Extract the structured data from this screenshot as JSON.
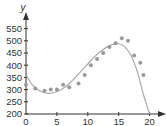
{
  "chart_data": {
    "type": "scatter",
    "title": "",
    "xlabel": "",
    "ylabel": "y",
    "xlim": [
      0,
      21
    ],
    "ylim": [
      200,
      580
    ],
    "x_ticks": [
      0,
      5,
      10,
      15,
      20
    ],
    "y_ticks": [
      200,
      250,
      300,
      350,
      400,
      450,
      500,
      550
    ],
    "grid": false,
    "legend": null,
    "series": [
      {
        "name": "data points",
        "type": "scatter",
        "color": "#999999",
        "x": [
          0,
          1.5,
          3,
          4,
          5,
          6,
          7,
          8.5,
          9.5,
          10.5,
          11.5,
          12.5,
          13.5,
          14.5,
          15.5,
          16.5,
          17.5,
          18.5,
          19
        ],
        "y": [
          320,
          305,
          295,
          300,
          300,
          320,
          310,
          325,
          360,
          400,
          425,
          450,
          475,
          490,
          510,
          500,
          440,
          410,
          360
        ]
      },
      {
        "name": "fitted curve",
        "type": "line",
        "color": "#aaaaaa",
        "x": [
          0,
          1,
          2,
          3,
          4,
          5,
          6,
          7,
          8,
          9,
          10,
          11,
          12,
          13,
          14,
          15,
          16,
          17,
          18,
          19,
          20
        ],
        "y": [
          360,
          320,
          298,
          287,
          285,
          292,
          305,
          325,
          350,
          378,
          405,
          432,
          455,
          473,
          485,
          488,
          475,
          440,
          375,
          280,
          200
        ]
      }
    ]
  }
}
